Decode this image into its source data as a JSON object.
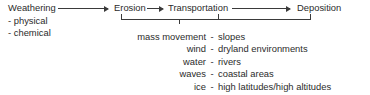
{
  "diagram": {
    "chain": [
      {
        "id": "weathering",
        "label": "Weathering"
      },
      {
        "id": "erosion",
        "label": "Erosion"
      },
      {
        "id": "transportation",
        "label": "Transportation"
      },
      {
        "id": "deposition",
        "label": "Deposition"
      }
    ],
    "weathering_types": [
      {
        "bullet": "-",
        "label": "physical"
      },
      {
        "bullet": "-",
        "label": "chemical"
      }
    ],
    "agents": {
      "separator": "-",
      "rows": [
        {
          "agent": "mass movement",
          "setting": "slopes"
        },
        {
          "agent": "wind",
          "setting": "dryland environments"
        },
        {
          "agent": "water",
          "setting": "rivers"
        },
        {
          "agent": "waves",
          "setting": "coastal areas"
        },
        {
          "agent": "ice",
          "setting": "high latitudes/high altitudes"
        }
      ]
    },
    "colors": {
      "text": "#2b2b2b",
      "line": "#3a3a3a",
      "background": "#ffffff"
    }
  }
}
